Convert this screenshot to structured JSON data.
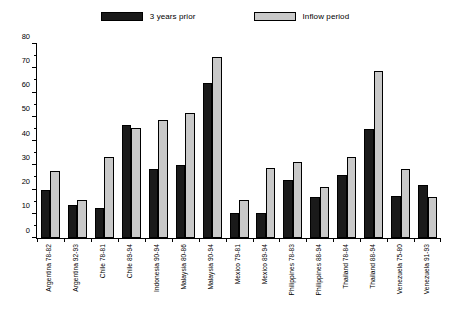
{
  "chart_data": {
    "type": "bar",
    "title": "",
    "subtitle": "",
    "xlabel": "",
    "ylabel": "",
    "ylim": [
      0,
      80
    ],
    "y_ticks": [
      0,
      10,
      20,
      30,
      40,
      50,
      60,
      70,
      80
    ],
    "y_tick_labels": [
      "0",
      "10",
      "20",
      "30",
      "40",
      "50",
      "60",
      "70",
      "80"
    ],
    "y_minor_ticks": [
      5,
      15,
      25,
      35,
      45,
      55,
      65,
      75
    ],
    "grid": false,
    "legend_position": "top-center",
    "categories": [
      "Argentina 78-82",
      "Argentina 92-93",
      "Chile 78-81",
      "Chile 89-94",
      "Indonesia 90-94",
      "Malaysia 80-86",
      "Malaysia 90-94",
      "Mexico 79-81",
      "Mexico 89-94",
      "Philippines 78-83",
      "Philippines 88-94",
      "Thailand 78-84",
      "Thailand 88-94",
      "Venezuela 75-80",
      "Venezuela 91-93"
    ],
    "series": [
      {
        "name": "3 years prior",
        "color": "#1a1a1a",
        "values": [
          20,
          13.5,
          12.5,
          46.5,
          28.5,
          30,
          64,
          10.5,
          10.5,
          24,
          17,
          26,
          45,
          17.5,
          22
        ]
      },
      {
        "name": "Inflow period",
        "color": "#c9c9c9",
        "values": [
          27.5,
          15.5,
          33.5,
          45.5,
          48.5,
          51.5,
          74.5,
          15.5,
          29,
          31.5,
          21,
          33.5,
          69,
          28.5,
          17
        ]
      }
    ]
  },
  "legend": {
    "entries": [
      {
        "label": "3 years prior",
        "swatch": "legend-swatch-prior"
      },
      {
        "label": "Inflow period",
        "swatch": "legend-swatch-inflow"
      }
    ]
  },
  "colors": {
    "prior": "#1a1a1a",
    "inflow": "#c9c9c9",
    "axis": "#000000",
    "background": "#ffffff"
  }
}
